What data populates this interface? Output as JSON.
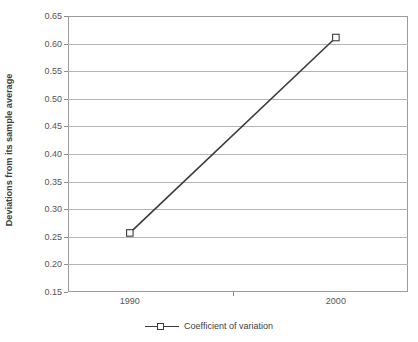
{
  "chart_data": {
    "type": "line",
    "title": "",
    "xlabel": "",
    "ylabel": "Deviations from its sample average",
    "x": [
      1990,
      2000
    ],
    "categories": [
      "1990",
      "2000"
    ],
    "xtick_labels": [
      "1990",
      "2000"
    ],
    "ytick_labels": [
      "0.65",
      "0.60",
      "0.55",
      "0.50",
      "0.45",
      "0.40",
      "0.35",
      "0.30",
      "0.25",
      "0.20",
      "0.15"
    ],
    "ytick_values": [
      0.65,
      0.6,
      0.55,
      0.5,
      0.45,
      0.4,
      0.35,
      0.3,
      0.25,
      0.2,
      0.15
    ],
    "ylim": [
      0.15,
      0.65
    ],
    "xlim": [
      1987,
      2003.5
    ],
    "grid": true,
    "legend_position": "bottom-center",
    "series": [
      {
        "name": "Coefficient of variation",
        "values": [
          0.257,
          0.611
        ],
        "line_color": "#3a3a3a",
        "marker": "square",
        "marker_fill": "#ffffff",
        "marker_edge": "#3a3a3a"
      }
    ]
  },
  "legend": {
    "entries": [
      {
        "label": "Coefficient of variation"
      }
    ]
  },
  "axes": {
    "frame_color": "#9b9b9b",
    "gridline_color": "#b5b5b5",
    "tick_color": "#8a8a8a",
    "label_color": "#555555"
  }
}
